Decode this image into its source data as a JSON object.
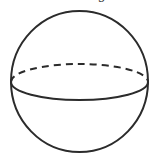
{
  "figure": {
    "type": "sphere",
    "top_label": "5",
    "stroke_color": "#2b2b2b",
    "background": "#ffffff",
    "outline": {
      "cx": 79.5,
      "cy": 81.5,
      "rx": 68.5,
      "ry": 70.5
    },
    "equator": {
      "cx": 79.5,
      "cy": 82,
      "rx": 68.5,
      "ry": 18,
      "back_style": "dashed",
      "front_style": "solid"
    }
  }
}
